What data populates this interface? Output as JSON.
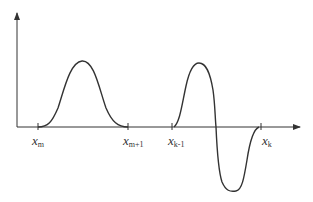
{
  "diagram": {
    "type": "waveform-axes",
    "colors": {
      "stroke": "#333333",
      "background": "#ffffff"
    },
    "axes": {
      "x_axis": "horizontal arrow",
      "y_axis": "vertical arrow"
    },
    "ticks": [
      {
        "id": "xm",
        "base": "x",
        "sub": "m"
      },
      {
        "id": "xm1",
        "base": "x",
        "sub": "m+1"
      },
      {
        "id": "xk1",
        "base": "x",
        "sub": "k-1"
      },
      {
        "id": "xk",
        "base": "x",
        "sub": "k"
      }
    ],
    "curves": [
      {
        "name": "positive-bump",
        "from": "x_m",
        "to": "x_m+1",
        "shape": "single positive hump"
      },
      {
        "name": "bipolar-wave",
        "from": "x_k-1",
        "to": "x_k",
        "shape": "positive lobe then negative lobe"
      }
    ]
  }
}
